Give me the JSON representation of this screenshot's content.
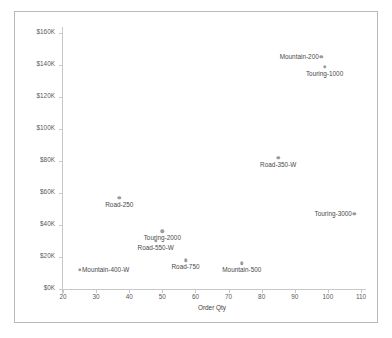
{
  "chart_data": {
    "type": "scatter",
    "title": "",
    "xlabel": "Order Qty",
    "ylabel": "Order Total",
    "xlim": [
      20,
      110
    ],
    "ylim": [
      0,
      160
    ],
    "xticks": [
      "20",
      "30",
      "40",
      "50",
      "60",
      "70",
      "80",
      "90",
      "100",
      "110"
    ],
    "xtick_values": [
      20,
      30,
      40,
      50,
      60,
      70,
      80,
      90,
      100,
      110
    ],
    "yticks": [
      "$0K",
      "$20K",
      "$40K",
      "$60K",
      "$80K",
      "$100K",
      "$120K",
      "$140K",
      "$160K"
    ],
    "ytick_values": [
      0,
      20,
      40,
      60,
      80,
      100,
      120,
      140,
      160
    ],
    "grid": false,
    "legend": "none",
    "marker_color": "#9b9b9b",
    "axis_color": "#c8c8c8",
    "frame_color": "#b9b9b9",
    "label_color": "#4a4a4a",
    "points": [
      {
        "label": "Mountain-200",
        "x": 98,
        "y": 145,
        "label_anchor": "right"
      },
      {
        "label": "Touring-1000",
        "x": 99,
        "y": 139,
        "label_anchor": "center"
      },
      {
        "label": "Road-350-W",
        "x": 85,
        "y": 82,
        "label_anchor": "center"
      },
      {
        "label": "Road-250",
        "x": 37,
        "y": 57,
        "label_anchor": "center"
      },
      {
        "label": "Touring-3000",
        "x": 108,
        "y": 47,
        "label_anchor": "right"
      },
      {
        "label": "Touring-2000",
        "x": 50,
        "y": 36,
        "label_anchor": "center"
      },
      {
        "label": "Road-550-W",
        "x": 48,
        "y": 30,
        "label_anchor": "center"
      },
      {
        "label": "Road-750",
        "x": 57,
        "y": 18,
        "label_anchor": "center"
      },
      {
        "label": "Mountain-500",
        "x": 74,
        "y": 16,
        "label_anchor": "center"
      },
      {
        "label": "Mountain-400-W",
        "x": 25,
        "y": 12,
        "label_anchor": "left"
      }
    ]
  }
}
